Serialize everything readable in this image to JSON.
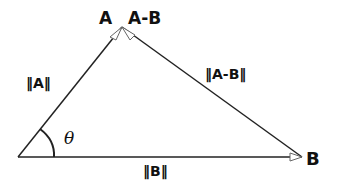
{
  "diagram": {
    "type": "vector-triangle",
    "labels": {
      "vertex_a": "A",
      "vertex_ab": "A-B",
      "norm_a": "‖A‖",
      "norm_ab": "‖A-B‖",
      "angle": "θ",
      "norm_b": "‖B‖",
      "vertex_b": "B"
    },
    "colors": {
      "line": "#222222",
      "text": "#111111",
      "background": "#ffffff"
    }
  }
}
